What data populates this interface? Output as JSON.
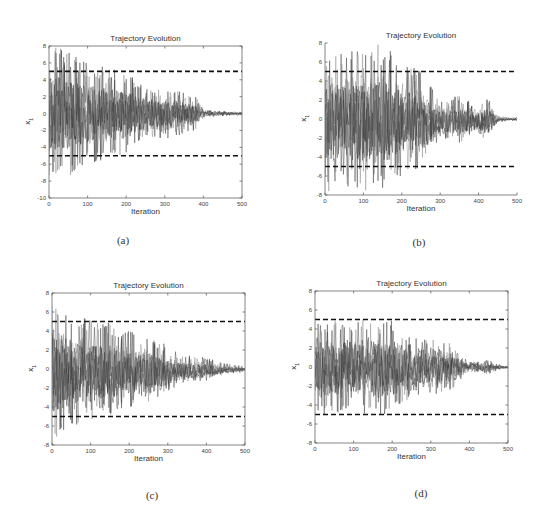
{
  "figure": {
    "panels": [
      {
        "id": "a",
        "caption": "(a)",
        "title": "Trajectory Evolution",
        "xlabel": "Iteration",
        "ylabel": "x",
        "ylabel_sub": "1",
        "box": {
          "left": 49,
          "top": 46,
          "right": 242,
          "bottom": 198
        },
        "full_box": true,
        "ylim": [
          -10,
          8
        ],
        "yticks": [
          -10,
          -8,
          -6,
          -4,
          -2,
          0,
          2,
          4,
          6,
          8
        ],
        "caption_pos": {
          "x": 123,
          "y": 234
        }
      },
      {
        "id": "b",
        "caption": "(b)",
        "title": "Trajectory Evolution",
        "xlabel": "Iteration",
        "ylabel": "x",
        "ylabel_sub": "1",
        "box": {
          "left": 325,
          "top": 43,
          "right": 517,
          "bottom": 195
        },
        "full_box": false,
        "ylim": [
          -8,
          8
        ],
        "yticks": [
          -8,
          -6,
          -4,
          -2,
          0,
          2,
          4,
          6,
          8
        ],
        "caption_pos": {
          "x": 419,
          "y": 236
        }
      },
      {
        "id": "c",
        "caption": "(c)",
        "title": "Trajectory Evolution",
        "xlabel": "Iteration",
        "ylabel": "x",
        "ylabel_sub": "1",
        "box": {
          "left": 52,
          "top": 293,
          "right": 245,
          "bottom": 445
        },
        "full_box": true,
        "ylim": [
          -8,
          8
        ],
        "yticks": [
          -8,
          -6,
          -4,
          -2,
          0,
          2,
          4,
          6,
          8
        ],
        "caption_pos": {
          "x": 152,
          "y": 489
        }
      },
      {
        "id": "d",
        "caption": "(d)",
        "title": "Trajectory Evolution",
        "xlabel": "Iteration",
        "ylabel": "x",
        "ylabel_sub": "1",
        "box": {
          "left": 315,
          "top": 291,
          "right": 508,
          "bottom": 443
        },
        "full_box": true,
        "ylim": [
          -8,
          8
        ],
        "yticks": [
          -8,
          -6,
          -4,
          -2,
          0,
          2,
          4,
          6,
          8
        ],
        "caption_pos": {
          "x": 421,
          "y": 487
        }
      }
    ]
  },
  "chart_data": [
    {
      "type": "line",
      "title": "Trajectory Evolution",
      "panel": "(a)",
      "xlabel": "Iteration",
      "ylabel": "x_1",
      "xlim": [
        0,
        500
      ],
      "ylim": [
        -10,
        8
      ],
      "xticks": [
        0,
        100,
        200,
        300,
        400,
        500
      ],
      "yticks": [
        -10,
        -8,
        -6,
        -4,
        -2,
        0,
        2,
        4,
        6,
        8
      ],
      "grid": false,
      "bounds": [
        {
          "name": "upper bound",
          "value": 5,
          "style": "dashed"
        },
        {
          "name": "lower bound",
          "value": -5,
          "style": "dashed"
        }
      ],
      "envelope": {
        "x": [
          0,
          50,
          100,
          150,
          200,
          250,
          300,
          350,
          380,
          400,
          450,
          500
        ],
        "max_abs": [
          8,
          7.5,
          6,
          5.5,
          5,
          3,
          3,
          2.5,
          2,
          0.5,
          0.3,
          0.2
        ]
      },
      "seed": 11,
      "extreme_min": -8,
      "extreme_max": 7.8
    },
    {
      "type": "line",
      "title": "Trajectory Evolution",
      "panel": "(b)",
      "xlabel": "Iteration",
      "ylabel": "x_1",
      "xlim": [
        0,
        500
      ],
      "ylim": [
        -8,
        8
      ],
      "xticks": [
        0,
        100,
        200,
        300,
        400,
        500
      ],
      "yticks": [
        -8,
        -6,
        -4,
        -2,
        0,
        2,
        4,
        6,
        8
      ],
      "grid": false,
      "bounds": [
        {
          "name": "upper bound",
          "value": 5,
          "style": "dashed"
        },
        {
          "name": "lower bound",
          "value": -5,
          "style": "dashed"
        }
      ],
      "envelope": {
        "x": [
          0,
          50,
          100,
          150,
          200,
          250,
          300,
          350,
          400,
          425,
          450,
          500
        ],
        "max_abs": [
          8,
          7,
          7.5,
          8,
          6,
          5.5,
          2,
          2.5,
          1.5,
          2.5,
          0.3,
          0.2
        ]
      },
      "seed": 23,
      "extreme_min": -6.7,
      "extreme_max": 8
    },
    {
      "type": "line",
      "title": "Trajectory Evolution",
      "panel": "(c)",
      "xlabel": "Iteration",
      "ylabel": "x_1",
      "xlim": [
        0,
        500
      ],
      "ylim": [
        -8,
        8
      ],
      "xticks": [
        0,
        100,
        200,
        300,
        400,
        500
      ],
      "yticks": [
        -8,
        -6,
        -4,
        -2,
        0,
        2,
        4,
        6,
        8
      ],
      "grid": false,
      "bounds": [
        {
          "name": "upper bound",
          "value": 5,
          "style": "dashed"
        },
        {
          "name": "lower bound",
          "value": -5,
          "style": "dashed"
        }
      ],
      "envelope": {
        "x": [
          0,
          50,
          100,
          150,
          200,
          250,
          300,
          350,
          400,
          450,
          500
        ],
        "max_abs": [
          8,
          6,
          5.5,
          5,
          4,
          3.5,
          2.5,
          1.5,
          1.2,
          0.6,
          0.3
        ]
      },
      "seed": 37,
      "extreme_min": -7.5,
      "extreme_max": 7.8
    },
    {
      "type": "line",
      "title": "Trajectory Evolution",
      "panel": "(d)",
      "xlabel": "Iteration",
      "ylabel": "x_1",
      "xlim": [
        0,
        500
      ],
      "ylim": [
        -8,
        8
      ],
      "xticks": [
        0,
        100,
        200,
        300,
        400,
        500
      ],
      "yticks": [
        -8,
        -6,
        -4,
        -2,
        0,
        2,
        4,
        6,
        8
      ],
      "grid": false,
      "bounds": [
        {
          "name": "upper bound",
          "value": 5,
          "style": "dashed"
        },
        {
          "name": "lower bound",
          "value": -5,
          "style": "dashed"
        }
      ],
      "envelope": {
        "x": [
          0,
          50,
          100,
          150,
          200,
          250,
          300,
          350,
          400,
          450,
          475,
          500
        ],
        "max_abs": [
          5,
          5,
          5,
          5,
          5,
          3,
          3,
          2.5,
          0.5,
          0.8,
          0.3,
          0.1
        ]
      },
      "clip": [
        -5,
        5
      ],
      "seed": 53,
      "extreme_min": -4.8,
      "extreme_max": 5
    }
  ],
  "colors": {
    "trace": "#3a3a3a",
    "trace_light": "#888888",
    "bound": "#111111",
    "axis": "#666666"
  }
}
